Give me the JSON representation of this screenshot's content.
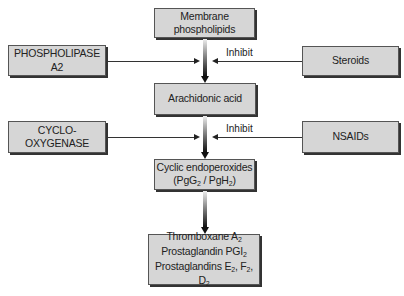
{
  "nodes": {
    "membrane": {
      "line1": "Membrane",
      "line2": "phospholipids"
    },
    "phospholipase": {
      "label": "PHOSPHOLIPASE A2"
    },
    "steroids": {
      "label": "Steroids"
    },
    "arachidonic": {
      "label": "Arachidonic acid"
    },
    "cyclooxygenase": {
      "label": "CYCLO-OXYGENASE"
    },
    "nsaids": {
      "label": "NSAIDs"
    },
    "cyclic": {
      "line1": "Cyclic endoperoxides",
      "line2_a": "(PgG",
      "line2_sub1": "2",
      "line2_b": " / PgH",
      "line2_sub2": "2",
      "line2_c": ")"
    },
    "products": {
      "line1": "Thromboxane  A",
      "line1_sub": "2",
      "line2": "Prostaglandin PGI",
      "line2_sub": "2",
      "line3_a": "Prostaglandins  E",
      "line3_s1": "2",
      "line3_b": ", F",
      "line3_s2": "2",
      "line3_c": ", D",
      "line3_s3": "2"
    }
  },
  "edges": {
    "inhibit1": "Inhibit",
    "inhibit2": "Inhibit"
  }
}
